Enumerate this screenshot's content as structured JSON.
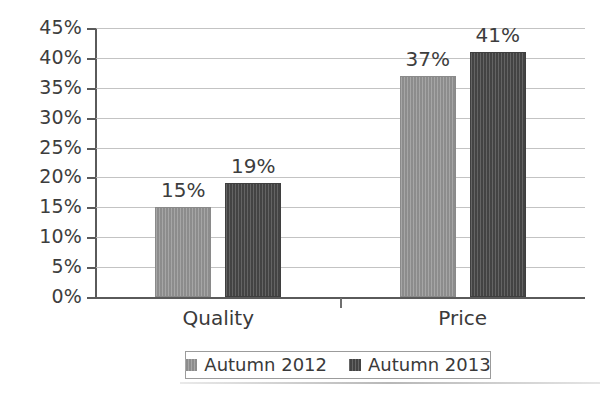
{
  "chart_data": {
    "type": "bar",
    "title": "",
    "subtitle": "",
    "xlabel": "",
    "ylabel": "",
    "categories": [
      "Quality",
      "Price"
    ],
    "series": [
      {
        "name": "Autumn 2012",
        "values": [
          15,
          37
        ],
        "labels": [
          "15%",
          "37%"
        ],
        "color": "#949494"
      },
      {
        "name": "Autumn 2013",
        "values": [
          19,
          41
        ],
        "labels": [
          "19%",
          "41%"
        ],
        "color": "#4b4b4b"
      }
    ],
    "ylim": [
      0,
      45
    ],
    "ytick_step": 5,
    "ytick_labels": [
      "45%",
      "40%",
      "35%",
      "30%",
      "25%",
      "20%",
      "15%",
      "10%",
      "5%",
      "0%"
    ],
    "ytick_values": [
      45,
      40,
      35,
      30,
      25,
      20,
      15,
      10,
      5,
      0
    ],
    "value_suffix": "%",
    "grid": true,
    "grid_axis": "y",
    "legend_position": "bottom",
    "data_labels": true,
    "background": "#ffffff",
    "gridline_color": "#b9b9b9",
    "axis_color": "#5a5a5a",
    "text_color": "#3a3a3a"
  },
  "legend": {
    "entries": [
      {
        "label": "Autumn 2012"
      },
      {
        "label": "Autumn 2013"
      }
    ]
  }
}
